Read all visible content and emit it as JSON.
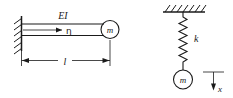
{
  "figure": {
    "stroke_color": "#1a1a1a",
    "background_color": "#ffffff",
    "width": 233,
    "height": 98
  },
  "left_diagram": {
    "name": "cantilever-beam-with-tip-mass",
    "labels": {
      "flexural_rigidity": "EI",
      "displacement": "η",
      "tip_mass": "m",
      "length": "l"
    },
    "support": {
      "type": "fixed-wall",
      "hatch_count": 6
    },
    "dimension": {
      "label": "l",
      "arrow_style": "double-headed"
    }
  },
  "right_diagram": {
    "name": "spring-mass-system",
    "labels": {
      "spring_constant": "k",
      "mass": "m",
      "coordinate": "x"
    },
    "support": {
      "type": "fixed-ceiling",
      "hatch_count": 7
    },
    "spring": {
      "coils": 11,
      "orientation": "vertical"
    },
    "coordinate_axis": {
      "label": "x",
      "direction": "downward"
    }
  }
}
